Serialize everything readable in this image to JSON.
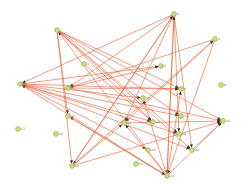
{
  "graph": {
    "edge_color": "#e8663d",
    "node_fill": "#c8e27a",
    "node_stroke": "#8aa845",
    "nodes": [
      {
        "id": "1",
        "x": 57,
        "y": 30,
        "label": "1"
      },
      {
        "id": "2",
        "x": 174,
        "y": 14,
        "label": "2"
      },
      {
        "id": "3",
        "x": 215,
        "y": 39,
        "label": "3"
      },
      {
        "id": "4",
        "x": 84,
        "y": 64,
        "label": "4"
      },
      {
        "id": "5",
        "x": 161,
        "y": 66,
        "label": "5"
      },
      {
        "id": "6",
        "x": 20,
        "y": 84,
        "label": "6"
      },
      {
        "id": "7",
        "x": 68,
        "y": 88,
        "label": "7"
      },
      {
        "id": "8",
        "x": 181,
        "y": 89,
        "label": "8"
      },
      {
        "id": "9",
        "x": 221,
        "y": 85,
        "label": "9"
      },
      {
        "id": "10",
        "x": 143,
        "y": 98,
        "label": "10"
      },
      {
        "id": "11",
        "x": 181,
        "y": 116,
        "label": "11"
      },
      {
        "id": "12",
        "x": 124,
        "y": 123,
        "label": "12"
      },
      {
        "id": "13",
        "x": 153,
        "y": 122,
        "label": "13"
      },
      {
        "id": "14",
        "x": 223,
        "y": 121,
        "label": "14"
      },
      {
        "id": "15",
        "x": 68,
        "y": 116,
        "label": "15"
      },
      {
        "id": "16",
        "x": 179,
        "y": 134,
        "label": "16"
      },
      {
        "id": "17",
        "x": 18,
        "y": 129,
        "label": "17"
      },
      {
        "id": "18",
        "x": 56,
        "y": 134,
        "label": "18"
      },
      {
        "id": "19",
        "x": 148,
        "y": 150,
        "label": "19"
      },
      {
        "id": "20",
        "x": 192,
        "y": 150,
        "label": "20"
      },
      {
        "id": "21",
        "x": 136,
        "y": 164,
        "label": "21"
      },
      {
        "id": "22",
        "x": 72,
        "y": 166,
        "label": "22"
      },
      {
        "id": "23",
        "x": 167,
        "y": 176,
        "label": "23"
      }
    ],
    "edges": [
      [
        "1",
        "15"
      ],
      [
        "1",
        "22"
      ],
      [
        "1",
        "8"
      ],
      [
        "1",
        "11"
      ],
      [
        "1",
        "14"
      ],
      [
        "1",
        "16"
      ],
      [
        "1",
        "20"
      ],
      [
        "2",
        "7"
      ],
      [
        "2",
        "22"
      ],
      [
        "2",
        "23"
      ],
      [
        "2",
        "20"
      ],
      [
        "2",
        "12"
      ],
      [
        "2",
        "6"
      ],
      [
        "2",
        "16"
      ],
      [
        "3",
        "7"
      ],
      [
        "3",
        "23"
      ],
      [
        "3",
        "12"
      ],
      [
        "6",
        "10"
      ],
      [
        "6",
        "11"
      ],
      [
        "6",
        "13"
      ],
      [
        "6",
        "16"
      ],
      [
        "6",
        "19"
      ],
      [
        "6",
        "20"
      ],
      [
        "6",
        "5"
      ],
      [
        "6",
        "8"
      ],
      [
        "7",
        "5"
      ],
      [
        "7",
        "8"
      ],
      [
        "7",
        "14"
      ],
      [
        "4",
        "13"
      ],
      [
        "22",
        "2"
      ],
      [
        "22",
        "3"
      ],
      [
        "22",
        "14"
      ],
      [
        "22",
        "12"
      ],
      [
        "23",
        "1"
      ],
      [
        "23",
        "6"
      ],
      [
        "23",
        "15"
      ],
      [
        "23",
        "14"
      ],
      [
        "23",
        "12"
      ],
      [
        "23",
        "8"
      ],
      [
        "23",
        "10"
      ],
      [
        "23",
        "2"
      ],
      [
        "15",
        "23"
      ],
      [
        "12",
        "14"
      ],
      [
        "20",
        "14"
      ],
      [
        "1",
        "13"
      ]
    ]
  }
}
